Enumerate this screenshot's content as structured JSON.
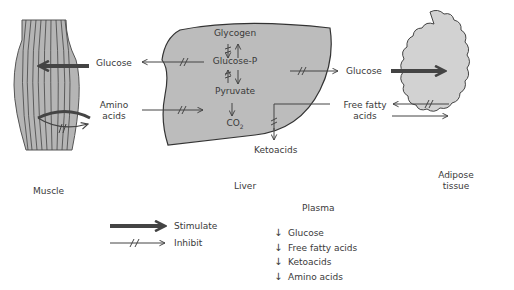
{
  "tissues": {
    "muscle": "Muscle",
    "liver": "Liver",
    "adipose_line1": "Adipose",
    "adipose_line2": "tissue"
  },
  "liver_pathway": {
    "glycogen": "Glycogen",
    "glucose_p": "Glucose-P",
    "pyruvate": "Pyruvate",
    "co2": "CO",
    "co2_sub": "2"
  },
  "flows": {
    "glucose_muscle": "Glucose",
    "amino_line1": "Amino",
    "amino_line2": "acids",
    "glucose_adipose": "Glucose",
    "ffa_line1": "Free fatty",
    "ffa_line2": "acids",
    "ketoacids": "Ketoacids"
  },
  "legend": {
    "stimulate": "Stimulate",
    "inhibit": "Inhibit"
  },
  "plasma": {
    "title": "Plasma",
    "items": [
      {
        "arrow": "↓",
        "label": "Glucose"
      },
      {
        "arrow": "↓",
        "label": "Free fatty acids"
      },
      {
        "arrow": "↓",
        "label": "Ketoacids"
      },
      {
        "arrow": "↓",
        "label": "Amino acids"
      }
    ]
  },
  "colors": {
    "tissue_fill": "#bdbdbd",
    "adipose_fill": "#d0d0d0",
    "stroke": "#333333",
    "stimulate_arrow": "#444444"
  }
}
